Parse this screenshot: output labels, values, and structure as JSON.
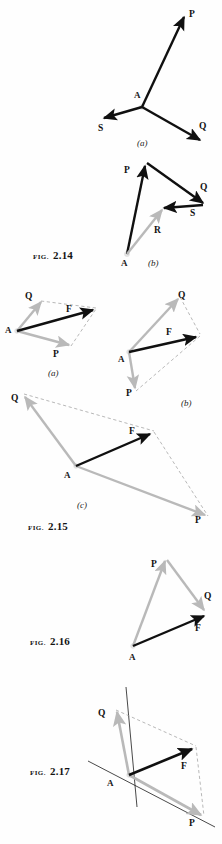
{
  "page": {
    "background": "#fefefe",
    "width": 222,
    "height": 844,
    "kind": "textbook-figure-plate"
  },
  "colors": {
    "resultant_black": "#101010",
    "component_gray": "#b9b9b9",
    "construction_dash": "#9a9a9a",
    "label_text": "#141414"
  },
  "figures": [
    {
      "id": "fig-2-14",
      "caption_word": "FIG.",
      "caption_num": "2.14",
      "parts": [
        {
          "key": "a",
          "part_label": "(a)",
          "point_label": "A",
          "vectors": [
            {
              "name": "P",
              "label": "P",
              "style": "black"
            },
            {
              "name": "Q",
              "label": "Q",
              "style": "black"
            },
            {
              "name": "S",
              "label": "S",
              "style": "black"
            }
          ]
        },
        {
          "key": "b",
          "part_label": "(b)",
          "point_label": "A",
          "vectors": [
            {
              "name": "P",
              "label": "P",
              "style": "black"
            },
            {
              "name": "Q",
              "label": "Q",
              "style": "black"
            },
            {
              "name": "S",
              "label": "S",
              "style": "black"
            },
            {
              "name": "R",
              "label": "R",
              "style": "gray"
            }
          ]
        }
      ]
    },
    {
      "id": "fig-2-15",
      "caption_word": "FIG.",
      "caption_num": "2.15",
      "parts": [
        {
          "key": "a",
          "part_label": "(a)",
          "point_label": "A",
          "vectors": [
            {
              "name": "Q",
              "label": "Q",
              "style": "gray"
            },
            {
              "name": "P",
              "label": "P",
              "style": "gray"
            },
            {
              "name": "F",
              "label": "F",
              "style": "black"
            }
          ]
        },
        {
          "key": "b",
          "part_label": "(b)",
          "point_label": "A",
          "vectors": [
            {
              "name": "Q",
              "label": "Q",
              "style": "gray"
            },
            {
              "name": "P",
              "label": "P",
              "style": "gray"
            },
            {
              "name": "F",
              "label": "F",
              "style": "black"
            }
          ]
        },
        {
          "key": "c",
          "part_label": "(c)",
          "point_label": "A",
          "vectors": [
            {
              "name": "Q",
              "label": "Q",
              "style": "gray"
            },
            {
              "name": "P",
              "label": "P",
              "style": "gray"
            },
            {
              "name": "F",
              "label": "F",
              "style": "black"
            }
          ]
        }
      ]
    },
    {
      "id": "fig-2-16",
      "caption_word": "FIG.",
      "caption_num": "2.16",
      "parts": [
        {
          "key": "main",
          "part_label": "",
          "point_label": "A",
          "vectors": [
            {
              "name": "P",
              "label": "P",
              "style": "gray"
            },
            {
              "name": "Q",
              "label": "Q",
              "style": "gray"
            },
            {
              "name": "F",
              "label": "F",
              "style": "black"
            }
          ]
        }
      ]
    },
    {
      "id": "fig-2-17",
      "caption_word": "FIG.",
      "caption_num": "2.17",
      "parts": [
        {
          "key": "main",
          "part_label": "",
          "point_label": "A",
          "vectors": [
            {
              "name": "Q",
              "label": "Q",
              "style": "gray"
            },
            {
              "name": "P",
              "label": "P",
              "style": "gray"
            },
            {
              "name": "F",
              "label": "F",
              "style": "black"
            }
          ]
        }
      ]
    }
  ],
  "labels": {
    "f214a_P": "P",
    "f214a_Q": "Q",
    "f214a_S": "S",
    "f214a_A": "A",
    "f214a_part": "(a)",
    "f214b_P": "P",
    "f214b_Q": "Q",
    "f214b_S": "S",
    "f214b_R": "R",
    "f214b_A": "A",
    "f214b_part": "(b)",
    "f214_word": "FIG.",
    "f214_num": "2.14",
    "f215a_Q": "Q",
    "f215a_P": "P",
    "f215a_F": "F",
    "f215a_A": "A",
    "f215a_part": "(a)",
    "f215b_Q": "Q",
    "f215b_P": "P",
    "f215b_F": "F",
    "f215b_A": "A",
    "f215b_part": "(b)",
    "f215c_Q": "Q",
    "f215c_P": "P",
    "f215c_F": "F",
    "f215c_A": "A",
    "f215c_part": "(c)",
    "f215_word": "FIG.",
    "f215_num": "2.15",
    "f216_P": "P",
    "f216_Q": "Q",
    "f216_F": "F",
    "f216_A": "A",
    "f216_word": "FIG.",
    "f216_num": "2.16",
    "f217_Q": "Q",
    "f217_P": "P",
    "f217_F": "F",
    "f217_A": "A",
    "f217_word": "FIG.",
    "f217_num": "2.17"
  }
}
